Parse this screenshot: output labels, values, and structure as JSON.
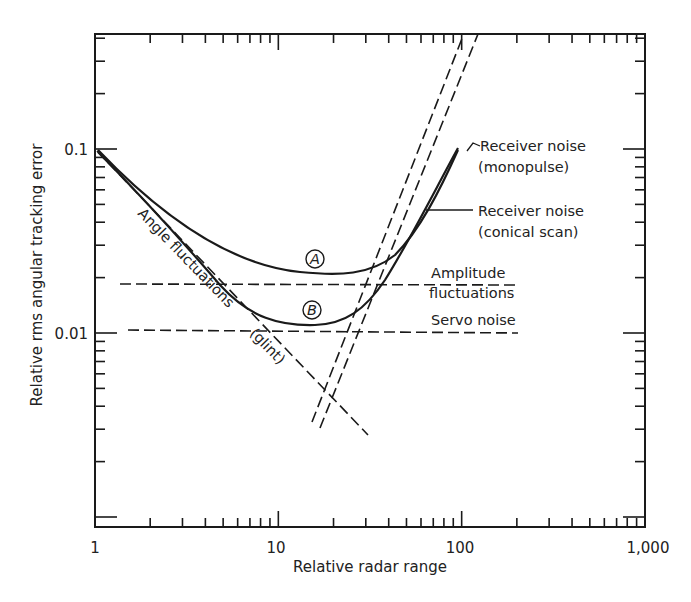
{
  "chart_data": {
    "type": "line",
    "title": "",
    "xlabel": "Relative radar range",
    "ylabel": "Relative rms angular tracking error",
    "xscale": "log",
    "yscale": "log",
    "xlim": [
      1,
      1000
    ],
    "ylim": [
      0.00088,
      0.42
    ],
    "x_tick_labels": [
      "1",
      "10",
      "100",
      "1,000"
    ],
    "x_ticks": [
      1,
      10,
      100,
      1000
    ],
    "y_tick_labels": [
      "0.1",
      "0.01"
    ],
    "y_ticks": [
      0.1,
      0.01
    ],
    "grid": false,
    "legend": "none (inline annotations)",
    "series": [
      {
        "name": "Curve A (total, conical scan)",
        "label": "A",
        "style": "solid",
        "x": [
          1,
          2,
          3,
          5,
          8,
          12,
          17,
          25,
          35,
          50,
          70,
          100
        ],
        "y": [
          0.1,
          0.054,
          0.038,
          0.028,
          0.023,
          0.021,
          0.0205,
          0.022,
          0.028,
          0.042,
          0.07,
          0.105
        ]
      },
      {
        "name": "Curve B (total, monopulse)",
        "label": "B",
        "style": "solid",
        "x": [
          1,
          2,
          3,
          5,
          8,
          12,
          15,
          20,
          30,
          40,
          60,
          100
        ],
        "y": [
          0.1,
          0.049,
          0.031,
          0.018,
          0.0128,
          0.0112,
          0.011,
          0.0115,
          0.0145,
          0.019,
          0.037,
          0.1
        ]
      },
      {
        "name": "Angle fluctuations (glint)",
        "style": "dashed",
        "x": [
          1,
          10,
          32
        ],
        "y": [
          0.1,
          0.0105,
          0.0029
        ]
      },
      {
        "name": "Amplitude fluctuations",
        "style": "dashed",
        "x": [
          1.15,
          200
        ],
        "y": [
          0.019,
          0.019
        ]
      },
      {
        "name": "Servo noise",
        "style": "dashed",
        "x": [
          1.2,
          200
        ],
        "y": [
          0.0105,
          0.0105
        ]
      },
      {
        "name": "Receiver noise (monopulse)",
        "style": "dashed",
        "x": [
          16,
          110
        ],
        "y": [
          0.0035,
          0.13
        ]
      },
      {
        "name": "Receiver noise (conical scan)",
        "style": "dashed",
        "x": [
          17.5,
          125
        ],
        "y": [
          0.0033,
          0.13
        ]
      }
    ],
    "annotations": [
      {
        "text": "Angle fluctuations",
        "note": "rotated along glint line"
      },
      {
        "text": "(glint)",
        "note": "rotated along glint line"
      },
      {
        "text": "Amplitude",
        "line2": "fluctuations"
      },
      {
        "text": "Servo noise"
      },
      {
        "text": "Receiver noise",
        "line2": "(monopulse)"
      },
      {
        "text": "Receiver noise",
        "line2": "(conical scan)"
      },
      {
        "text": "A",
        "note": "circled label on upper total curve"
      },
      {
        "text": "B",
        "note": "circled label on lower total curve"
      }
    ]
  },
  "labels": {
    "xlabel": "Relative radar range",
    "ylabel": "Relative rms angular tracking error",
    "xticks": [
      "1",
      "10",
      "100",
      "1,000"
    ],
    "yticks": [
      "0.1",
      "0.01"
    ],
    "glint_1": "Angle fluctuations",
    "glint_2": "(glint)",
    "amp_1": "Amplitude",
    "amp_2": "fluctuations",
    "servo": "Servo noise",
    "mono_1": "Receiver noise",
    "mono_2": "(monopulse)",
    "coni_1": "Receiver noise",
    "coni_2": "(conical scan)",
    "curve_a": "A",
    "curve_b": "B"
  }
}
